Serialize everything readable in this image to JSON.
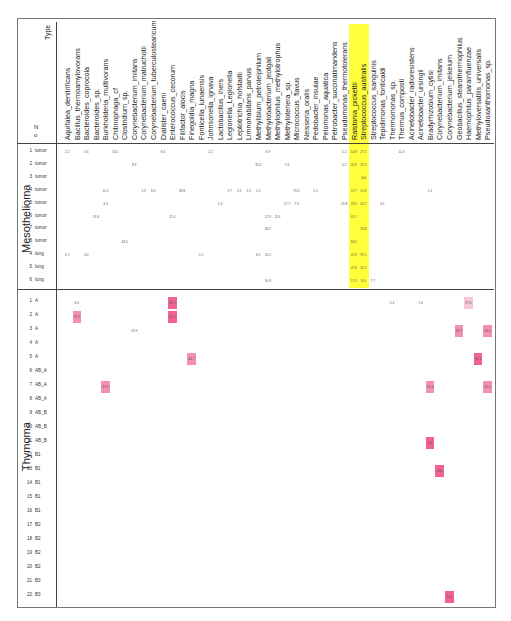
{
  "chart_data": {
    "type": "heatmap",
    "title": "",
    "row_header_labels": {
      "n": "N\no",
      "type": "Type"
    },
    "highlighted_columns": [
      "Ralstonia_pickettii",
      "Streptococcus_australis"
    ],
    "highlight_color": "#ffff3b",
    "value_colors": {
      "low": "#f7c5db",
      "mid": "#f48fb5",
      "high": "#f06292"
    },
    "columns": [
      "Aquifalea_denitrificans",
      "Bacillus_thermoamylovorans",
      "Bacteroides_coprocola",
      "Bacteroides_sp.",
      "Burkholderia_multivorans",
      "Chitinophaga_cf",
      "Clostridium_sp.",
      "Corynebacterium_imitans",
      "Corynebacterium_matruchotii",
      "Corynebacterium_tuberculostearicum",
      "Dialister_caeni",
      "Enterococcus_cecorum",
      "Filifactor_alocis",
      "Finegoldia_magna",
      "Fonticella_lunaensis",
      "Johnsonella_ignava",
      "Lactobacillus_iners",
      "Legionella_Legionella",
      "Leptotrichia_hofstadii",
      "Limnohabitans_parvus",
      "Methylibium_petroleiphilum",
      "Methylobacterium_jeotgali",
      "Methylophilus_methylotrophus",
      "Methylotenera_sp.",
      "Micrococcus_flavus",
      "Neisseria_oralis",
      "Pedobacter_insulae",
      "Pelomonas_aquatica",
      "Petrobacter_succinatimandens",
      "Pseudomonas_thermotolerans",
      "Ralstonia_pickettii",
      "Streptococcus_australis",
      "Streptococcus_sanguinis",
      "Tepidimonas_fonticaldi",
      "Thermomonas_sp.",
      "Thermus_composti",
      "Acinetobacter_radioresistens",
      "Acinetobacter_ursingii",
      "Bradyrhizobium_cytisi",
      "Corynebacterium_imitans",
      "Corynebacterium_jeikeium",
      "Geobacillus_stearothermophilus",
      "Haemophilus_parainfluenzae",
      "Methyloversatilis_universalis",
      "Pseudoxanthomonas_sp."
    ],
    "groups": [
      {
        "name": "Mesothelioma",
        "rows": [
          {
            "n": "1",
            "type": "tumor",
            "cells": {
              "0": "2.2",
              "2": "5.6",
              "5": "13.0",
              "10": "9.4",
              "15": "2.2",
              "21": "6.9",
              "29": "5.2",
              "30": "14.8",
              "31": "27.1",
              "35": "11.6"
            }
          },
          {
            "n": "2",
            "type": "tumor",
            "cells": {
              "7": "8.3",
              "20": "31.0",
              "23": "7.3",
              "29": "5.2",
              "30": "20.9",
              "31": "25.5"
            }
          },
          {
            "n": "3",
            "type": "tumor",
            "cells": {
              "31": "100"
            }
          },
          {
            "n": "4",
            "type": "tumor",
            "cells": {
              "4": "11.2",
              "8": "1.3",
              "9": "8.5",
              "12": "28.8",
              "17": "1.7",
              "18": "2.3",
              "19": "2.3",
              "20": "2.1",
              "24": "73.2",
              "26": "2.1",
              "30": "12.7",
              "31": "11.8",
              "38": "2.1"
            }
          },
          {
            "n": "5",
            "type": "tumor",
            "cells": {
              "4": "3.3",
              "16": "1.6",
              "23": "17.7",
              "24": "7.3",
              "29": "23.8",
              "30": "23.9",
              "31": "24.7",
              "33": "6.1"
            }
          },
          {
            "n": "6",
            "type": "tumor",
            "cells": {
              "3": "13.4",
              "11": "11.0",
              "21": "12.9",
              "22": "11.3",
              "30": "61.7"
            }
          },
          {
            "n": "7",
            "type": "tumor",
            "cells": {
              "21": "46.2",
              "31": "53.8"
            }
          },
          {
            "n": "8",
            "type": "tumor",
            "cells": {
              "6": "34.5",
              "30": "64.5"
            }
          },
          {
            "n": "4",
            "type": "lung",
            "cells": {
              "0": "0.7",
              "2": "3.4",
              "14": "5.1",
              "20": "8.1",
              "21": "10.2",
              "30": "22.9",
              "31": "37.1"
            }
          },
          {
            "n": "5",
            "type": "lung",
            "cells": {
              "30": "47.8",
              "31": "52.2"
            }
          },
          {
            "n": "6",
            "type": "lung",
            "cells": {
              "21": "30.9",
              "30": "17.5",
              "31": "8.0",
              "32": "7.7"
            }
          }
        ]
      },
      {
        "name": "Thymoma",
        "rows": [
          {
            "n": "1",
            "type": "A",
            "cells": {
              "1": "6.6",
              "11": "51.1",
              "34": "5.4",
              "37": "7.4",
              "42": "27.6"
            }
          },
          {
            "n": "2",
            "type": "A",
            "cells": {
              "1": "32.9",
              "11": "51.1"
            }
          },
          {
            "n": "3",
            "type": "A",
            "cells": {
              "7": "13.9",
              "41": "44.7",
              "44": "44.4"
            }
          },
          {
            "n": "4",
            "type": "A",
            "cells": {}
          },
          {
            "n": "5",
            "type": "A",
            "cells": {
              "13": "44.7",
              "43": "51.1"
            }
          },
          {
            "n": "6",
            "type": "AB_A",
            "cells": {}
          },
          {
            "n": "7",
            "type": "AB_A",
            "cells": {
              "4": "27.9",
              "38": "31.6",
              "44": "30.3"
            }
          },
          {
            "n": "8",
            "type": "AB_A",
            "cells": {}
          },
          {
            "n": "9",
            "type": "AB_B",
            "cells": {}
          },
          {
            "n": "10",
            "type": "AB_B",
            "cells": {}
          },
          {
            "n": "11",
            "type": "AB_B",
            "cells": {
              "38": "100"
            }
          },
          {
            "n": "12",
            "type": "B1",
            "cells": {}
          },
          {
            "n": "13",
            "type": "B1",
            "cells": {
              "39": "100"
            }
          },
          {
            "n": "14",
            "type": "B1",
            "cells": {}
          },
          {
            "n": "15",
            "type": "B1",
            "cells": {}
          },
          {
            "n": "16",
            "type": "B1",
            "cells": {}
          },
          {
            "n": "17",
            "type": "B2",
            "cells": {}
          },
          {
            "n": "18",
            "type": "B2",
            "cells": {}
          },
          {
            "n": "19",
            "type": "B2",
            "cells": {}
          },
          {
            "n": "20",
            "type": "B2",
            "cells": {}
          },
          {
            "n": "21",
            "type": "B3",
            "cells": {}
          },
          {
            "n": "22",
            "type": "B3",
            "cells": {
              "40": "100"
            }
          }
        ]
      }
    ],
    "pink_cells": [
      {
        "group": 1,
        "row": 0,
        "col": 11,
        "level": "high"
      },
      {
        "group": 1,
        "row": 1,
        "col": 11,
        "level": "high"
      },
      {
        "group": 1,
        "row": 0,
        "col": 42,
        "level": "low"
      },
      {
        "group": 1,
        "row": 1,
        "col": 1,
        "level": "mid"
      },
      {
        "group": 1,
        "row": 2,
        "col": 41,
        "level": "mid"
      },
      {
        "group": 1,
        "row": 2,
        "col": 44,
        "level": "mid"
      },
      {
        "group": 1,
        "row": 4,
        "col": 13,
        "level": "mid"
      },
      {
        "group": 1,
        "row": 4,
        "col": 43,
        "level": "high"
      },
      {
        "group": 1,
        "row": 6,
        "col": 4,
        "level": "mid"
      },
      {
        "group": 1,
        "row": 6,
        "col": 38,
        "level": "mid"
      },
      {
        "group": 1,
        "row": 6,
        "col": 44,
        "level": "mid"
      },
      {
        "group": 1,
        "row": 10,
        "col": 38,
        "level": "high"
      },
      {
        "group": 1,
        "row": 12,
        "col": 39,
        "level": "high"
      },
      {
        "group": 1,
        "row": 21,
        "col": 40,
        "level": "high"
      }
    ]
  }
}
